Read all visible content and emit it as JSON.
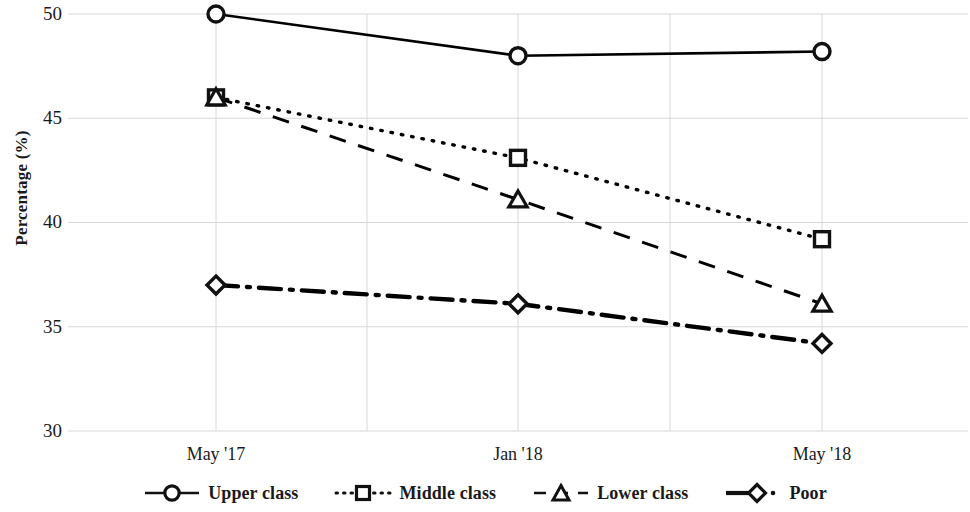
{
  "chart_data": {
    "type": "line",
    "title": "",
    "xlabel": "",
    "ylabel": "Percentage (%)",
    "categories": [
      "May '17",
      "Jan '18",
      "May '18"
    ],
    "ylim": [
      30,
      50
    ],
    "yticks": [
      30,
      35,
      40,
      45,
      50
    ],
    "grid": true,
    "legend_position": "bottom",
    "series": [
      {
        "name": "Upper class",
        "marker": "circle",
        "linestyle": "solid",
        "color": "#000000",
        "values": [
          50.0,
          48.0,
          48.2
        ]
      },
      {
        "name": "Middle class",
        "marker": "square",
        "linestyle": "dotted",
        "color": "#000000",
        "values": [
          46.0,
          43.1,
          39.2
        ]
      },
      {
        "name": "Lower class",
        "marker": "triangle",
        "linestyle": "dashed",
        "color": "#000000",
        "values": [
          46.0,
          41.1,
          36.1
        ]
      },
      {
        "name": "Poor",
        "marker": "diamond",
        "linestyle": "dash-dot",
        "color": "#000000",
        "values": [
          37.0,
          36.1,
          34.2
        ]
      }
    ]
  },
  "axis": {
    "y_title": "Percentage (%)",
    "y_tick_labels": [
      "50",
      "45",
      "40",
      "35",
      "30"
    ],
    "x_tick_labels": [
      "May '17",
      "Jan '18",
      "May '18"
    ]
  },
  "legend": {
    "items": [
      {
        "label": "Upper class",
        "marker": "circle-marker",
        "linestyle": "solid"
      },
      {
        "label": "Middle class",
        "marker": "square-marker",
        "linestyle": "dotted"
      },
      {
        "label": "Lower class",
        "marker": "triangle-marker",
        "linestyle": "dashed"
      },
      {
        "label": "Poor",
        "marker": "diamond-marker",
        "linestyle": "dash-dot"
      }
    ]
  },
  "style": {
    "line_color": "#111111",
    "grid_color": "#d8d8d8",
    "background": "#ffffff"
  }
}
